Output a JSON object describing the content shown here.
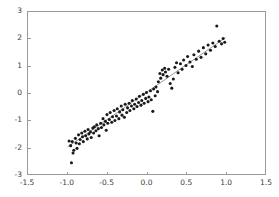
{
  "chart_data": {
    "type": "scatter",
    "title": "",
    "subtitle": "",
    "xlabel": "",
    "ylabel": "",
    "xlim": [
      -1.5,
      1.5
    ],
    "ylim": [
      -3,
      3
    ],
    "grid": false,
    "legend": false,
    "xticks": [
      -1.5,
      -1.0,
      -0.5,
      0.0,
      0.5,
      1.0,
      1.5
    ],
    "xticklabels": [
      "-1.5",
      "-1.0",
      "-0.5",
      "0.0",
      "0.5",
      "1.0",
      "1.5"
    ],
    "yticks": [
      -3,
      -2,
      -1,
      0,
      1,
      2,
      3
    ],
    "yticklabels": [
      "-3",
      "-2",
      "-1",
      "0",
      "1",
      "2",
      "3"
    ],
    "marker": {
      "shape": "circle",
      "color": "#1a1a1a",
      "size": 3.1
    },
    "fit_line": {
      "color": "#8c8c8c",
      "width": 0.9,
      "x": [
        -1.0,
        1.0
      ],
      "y": [
        -2.0,
        2.05
      ]
    },
    "series": [
      {
        "name": "samples",
        "x": [
          -0.98,
          -0.96,
          -0.95,
          -0.94,
          -0.93,
          -0.92,
          -0.9,
          -0.89,
          -0.88,
          -0.86,
          -0.85,
          -0.84,
          -0.82,
          -0.81,
          -0.8,
          -0.78,
          -0.77,
          -0.75,
          -0.74,
          -0.73,
          -0.71,
          -0.7,
          -0.68,
          -0.67,
          -0.66,
          -0.64,
          -0.63,
          -0.61,
          -0.6,
          -0.58,
          -0.57,
          -0.55,
          -0.54,
          -0.52,
          -0.51,
          -0.5,
          -0.49,
          -0.47,
          -0.46,
          -0.44,
          -0.43,
          -0.41,
          -0.4,
          -0.38,
          -0.37,
          -0.35,
          -0.34,
          -0.32,
          -0.31,
          -0.3,
          -0.28,
          -0.27,
          -0.25,
          -0.24,
          -0.22,
          -0.21,
          -0.19,
          -0.18,
          -0.16,
          -0.15,
          -0.13,
          -0.12,
          -0.1,
          -0.09,
          -0.07,
          -0.06,
          -0.04,
          -0.03,
          -0.01,
          0.0,
          0.02,
          0.03,
          0.05,
          0.06,
          0.08,
          0.09,
          0.11,
          0.12,
          0.14,
          0.15,
          0.17,
          0.18,
          0.2,
          0.21,
          0.23,
          0.24,
          0.26,
          0.28,
          0.3,
          0.32,
          0.34,
          0.36,
          0.38,
          0.4,
          0.43,
          0.45,
          0.47,
          0.5,
          0.52,
          0.55,
          0.58,
          0.6,
          0.63,
          0.66,
          0.69,
          0.72,
          0.75,
          0.78,
          0.81,
          0.84,
          0.87,
          0.89,
          0.92,
          0.95,
          0.97,
          0.99
        ],
        "y": [
          -1.78,
          -1.95,
          -2.58,
          -1.8,
          -2.22,
          -2.12,
          -1.68,
          -1.85,
          -2.05,
          -1.55,
          -1.88,
          -1.72,
          -1.48,
          -1.62,
          -1.8,
          -1.42,
          -1.58,
          -1.7,
          -1.35,
          -1.52,
          -1.44,
          -1.65,
          -1.3,
          -1.48,
          -1.25,
          -1.4,
          -1.18,
          -1.32,
          -1.58,
          -1.12,
          -1.28,
          -0.95,
          -1.18,
          -1.05,
          -1.38,
          -0.8,
          -1.12,
          -0.98,
          -0.72,
          -1.08,
          -0.88,
          -0.65,
          -1.02,
          -0.85,
          -0.58,
          -0.95,
          -0.7,
          -0.48,
          -0.82,
          -0.62,
          -0.9,
          -0.42,
          -0.72,
          -0.55,
          -0.38,
          -0.65,
          -0.48,
          -0.28,
          -0.58,
          -0.42,
          -0.22,
          -0.5,
          -0.35,
          -0.12,
          -0.45,
          -0.28,
          -0.05,
          -0.38,
          -0.2,
          0.02,
          -0.32,
          -0.15,
          0.08,
          -0.25,
          -0.68,
          0.15,
          -0.1,
          0.22,
          0.05,
          0.42,
          0.72,
          0.55,
          0.85,
          0.68,
          0.92,
          0.78,
          0.62,
          0.88,
          0.35,
          0.18,
          0.52,
          0.95,
          1.12,
          0.75,
          1.08,
          0.88,
          1.22,
          1.02,
          1.35,
          1.15,
          0.98,
          1.42,
          1.25,
          1.55,
          1.32,
          1.68,
          1.45,
          1.78,
          1.58,
          1.85,
          1.72,
          2.48,
          1.92,
          1.82,
          2.02,
          1.88
        ]
      }
    ]
  }
}
